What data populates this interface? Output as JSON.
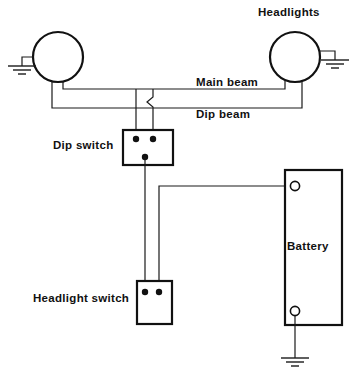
{
  "diagram": {
    "line_color": "#111111",
    "background_color": "#ffffff",
    "labels": {
      "headlights": "Headlights",
      "main_beam": "Main beam",
      "dip_beam": "Dip beam",
      "dip_switch": "Dip switch",
      "headlight_switch": "Headlight switch",
      "battery": "Battery"
    },
    "components": [
      {
        "name": "left-headlight",
        "type": "lamp",
        "shape": "circle",
        "cx": 58,
        "cy": 57,
        "r": 25,
        "grounded": true
      },
      {
        "name": "right-headlight",
        "type": "lamp",
        "shape": "circle",
        "cx": 295,
        "cy": 57,
        "r": 25,
        "grounded": true
      },
      {
        "name": "dip-switch",
        "type": "switch",
        "shape": "rect",
        "x": 123,
        "y": 130,
        "width": 50,
        "height": 35,
        "terminals": 3
      },
      {
        "name": "headlight-switch",
        "type": "switch",
        "shape": "rect",
        "x": 137,
        "y": 281,
        "width": 35,
        "height": 43,
        "terminals": 2
      },
      {
        "name": "battery",
        "type": "battery",
        "shape": "rect",
        "x": 285,
        "y": 170,
        "width": 57,
        "height": 155,
        "terminals": 2,
        "grounded": true
      }
    ],
    "grounds": [
      {
        "name": "left-headlight-ground",
        "x": 14,
        "y": 66
      },
      {
        "name": "right-headlight-ground",
        "x": 335,
        "y": 60
      },
      {
        "name": "battery-ground",
        "x": 300,
        "y": 358
      }
    ],
    "wires": [
      {
        "name": "main-beam-wire",
        "from": "left-headlight",
        "to": "right-headlight"
      },
      {
        "name": "dip-beam-wire",
        "from": "left-headlight",
        "to": "right-headlight"
      },
      {
        "name": "main-beam-to-dip-switch",
        "from": "main-beam-wire",
        "to": "dip-switch"
      },
      {
        "name": "dip-beam-to-dip-switch",
        "from": "dip-beam-wire",
        "to": "dip-switch"
      },
      {
        "name": "dip-switch-to-headlight-switch",
        "from": "dip-switch",
        "to": "headlight-switch"
      },
      {
        "name": "headlight-switch-to-battery",
        "from": "headlight-switch",
        "to": "battery"
      }
    ],
    "wire_crossing": {
      "name": "wire-hop",
      "style": "s-jog",
      "x": 153,
      "y": 102
    }
  }
}
